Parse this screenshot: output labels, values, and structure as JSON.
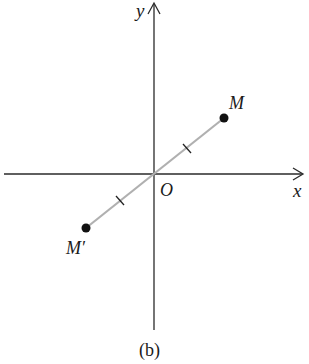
{
  "diagram": {
    "axes": {
      "x_label": "x",
      "y_label": "y",
      "origin_label": "O"
    },
    "points": [
      {
        "name": "M",
        "label": "M"
      },
      {
        "name": "M-prime",
        "label": "M′"
      }
    ],
    "caption": "(b)",
    "colors": {
      "axis": "#2a2a2a",
      "segment": "#b0b0b0",
      "point": "#111111"
    }
  }
}
